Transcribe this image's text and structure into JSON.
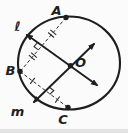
{
  "colors": {
    "background": "#fbfbfb",
    "ink": "#1e1e1e",
    "thin": "#2a2a2a",
    "edge_strip": "#e4e4e4"
  },
  "diagram": {
    "circle": {
      "cx": 69,
      "cy": 63,
      "rx": 51,
      "ry": 46.5,
      "stroke_width": 2.1
    },
    "points": [
      {
        "id": "A",
        "label": "A",
        "x": 66,
        "y": 17.5,
        "label_x": 56.5,
        "label_y": 10.5
      },
      {
        "id": "B",
        "label": "B",
        "x": 20,
        "y": 71.5,
        "label_x": 10.5,
        "label_y": 70.5
      },
      {
        "id": "C",
        "label": "C",
        "x": 68,
        "y": 107.5,
        "label_x": 63,
        "label_y": 119.5
      },
      {
        "id": "O",
        "label": "O",
        "x": 70.5,
        "y": 65.8,
        "label_x": 80.5,
        "label_y": 62.5
      }
    ],
    "lines": [
      {
        "id": "l",
        "label": "ℓ",
        "x1": 26.5,
        "y1": 34.5,
        "x2": 97.5,
        "y2": 85.5,
        "label_x": 17.5,
        "label_y": 26.5
      },
      {
        "id": "m",
        "label": "m",
        "x1": 33.5,
        "y1": 102.5,
        "x2": 94.5,
        "y2": 43.5,
        "label_x": 17.5,
        "label_y": 111.5
      }
    ],
    "chords": [
      {
        "id": "AB",
        "from": "A",
        "to": "B",
        "tick_count": 2,
        "ticks_at": [
          0.3,
          0.72
        ]
      },
      {
        "id": "BC",
        "from": "B",
        "to": "C",
        "tick_count": 1,
        "ticks_at": [
          0.26,
          0.78
        ]
      }
    ],
    "right_angle_marks": [
      {
        "id": "AB",
        "points": "38.5,49.9 34.0,46.7 37.5,42.5"
      },
      {
        "id": "BC",
        "points": "49.8,94.3 53.8,90.5 49.4,87.2"
      }
    ]
  }
}
